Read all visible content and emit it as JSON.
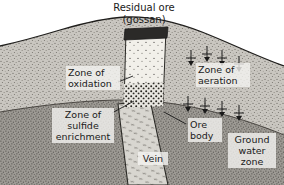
{
  "figure": {
    "title_line1": "Residual ore",
    "title_line2": "(gossan)",
    "title_full": "Residual ore\n(gossan)"
  },
  "labels": {
    "oxidation": "Zone of\noxidation",
    "aeration": "Zone of\naeration",
    "sulfide_enrichment": "Zone of\nsulfide\nenrichment",
    "ore_body": "Ore\nbody",
    "ground_water_zone": "Ground\nwater\nzone",
    "vein": "Vein"
  },
  "colors": {
    "background": "#ffffff",
    "ink": "#1a1a1a",
    "unsaturated_rock": "#c9c6c0",
    "saturated_rock": "#9d9a94",
    "gossan_fill": "#f2f0ea",
    "gossan_cap": "#2b2a28",
    "vein_fill": "#d8d6d0",
    "label_backing": "#f4f3f0"
  },
  "annotations": {
    "infiltration_arrow_count": 8,
    "infiltration_direction": "down"
  }
}
